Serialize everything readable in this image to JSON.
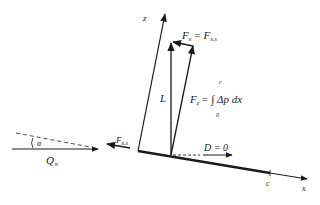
{
  "diagram": {
    "colors": {
      "ink": "#1a1a1a",
      "background": "#ffffff"
    },
    "axes": {
      "z_label": "z",
      "x_label": "x",
      "chord_label": "c"
    },
    "labels": {
      "fx_top": "F",
      "fx_top_sub": "x",
      "fx_top_eq": "= F",
      "fx_top_eq_sub": "x,s",
      "lift": "L",
      "fz_eq": "F",
      "fz_sub": "z",
      "fz_rhs": "= ∫ Δp dx",
      "fz_upper_limit": "c",
      "fz_lower_limit": "0",
      "drag": "D = 0",
      "suction_force": "F",
      "suction_force_sub": "x,s",
      "alpha": "α",
      "freestream": "Q",
      "freestream_sub": "∞"
    }
  }
}
